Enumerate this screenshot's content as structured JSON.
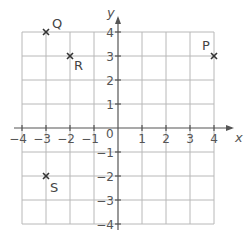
{
  "diagram": {
    "type": "coordinate-grid",
    "origin_label": "0",
    "x_axis": {
      "label": "x",
      "min": -4,
      "max": 4,
      "ticks": [
        "-4",
        "-3",
        "-2",
        "-1",
        "1",
        "2",
        "3",
        "4"
      ]
    },
    "y_axis": {
      "label": "y",
      "min": -4,
      "max": 4,
      "ticks": [
        "4",
        "3",
        "2",
        "1",
        "-1",
        "-2",
        "-3",
        "-4"
      ]
    },
    "points": [
      {
        "label": "P",
        "x": 4,
        "y": 3
      },
      {
        "label": "Q",
        "x": -3,
        "y": 4
      },
      {
        "label": "R",
        "x": -2,
        "y": 3
      },
      {
        "label": "S",
        "x": -3,
        "y": -2
      }
    ],
    "colors": {
      "grid": "#b8b8b8",
      "axis": "#555555",
      "text": "#555555"
    }
  }
}
